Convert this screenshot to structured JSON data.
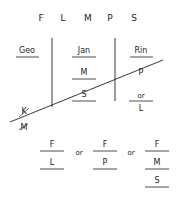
{
  "header": {
    "letters": [
      "F",
      "L",
      "M",
      "P",
      "S"
    ]
  },
  "columns": [
    {
      "name": "col-1",
      "items": [
        "Geo"
      ]
    },
    {
      "name": "col-2",
      "items": [
        "Jan",
        "M",
        "S"
      ]
    },
    {
      "name": "col-3",
      "items": [
        "Rin",
        "P",
        "or",
        "L"
      ]
    }
  ],
  "struck_out": [
    "K",
    "M"
  ],
  "options": {
    "connector": "or",
    "groups": [
      [
        "F",
        "L"
      ],
      [
        "F",
        "P"
      ],
      [
        "F",
        "M",
        "S"
      ]
    ]
  },
  "colors": {
    "ink": "#222222",
    "background": "#ffffff"
  }
}
